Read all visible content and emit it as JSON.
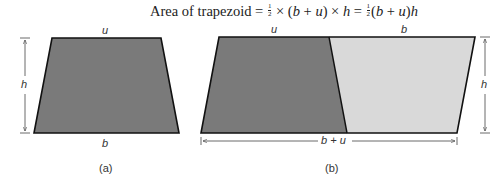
{
  "title": {
    "prefix": "Area of trapezoid = ",
    "half_num": "1",
    "half_den": "2",
    "part1": " × (",
    "b": "b",
    "plus": " + ",
    "u": "u",
    "part2": ") × ",
    "h": "h",
    "eq": " = ",
    "part3": "(",
    "part4": ")"
  },
  "figure_a": {
    "top_label": "u",
    "bottom_label": "b",
    "height_label": "h",
    "caption": "(a)",
    "fill": "#7a7a7a"
  },
  "figure_b": {
    "top_left_label": "u",
    "top_right_label": "b",
    "height_label": "h",
    "width_label": "b + u",
    "caption": "(b)",
    "dark_fill": "#7a7a7a",
    "light_fill": "#d9d9d9"
  }
}
